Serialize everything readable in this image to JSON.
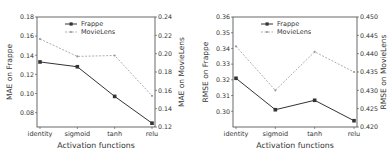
{
  "chart_data": [
    {
      "type": "line",
      "categories": [
        "identity",
        "sigmoid",
        "tanh",
        "relu"
      ],
      "xlabel": "Activation functions",
      "ylabel": "MAE on Frappe",
      "ylabel_right": "MAE on MovieLens",
      "ylim": [
        0.065,
        0.18
      ],
      "ylim_right": [
        0.12,
        0.24
      ],
      "yticks": [
        "0.08",
        "0.10",
        "0.12",
        "0.14",
        "0.16",
        "0.18"
      ],
      "yticks_right": [
        "0.12",
        "0.14",
        "0.16",
        "0.18",
        "0.20",
        "0.22",
        "0.24"
      ],
      "legend_position": "upper center",
      "grid": false,
      "series": [
        {
          "name": "Frappe",
          "axis": "left",
          "style": "solid",
          "marker": "square",
          "values": [
            0.133,
            0.128,
            0.097,
            0.069
          ]
        },
        {
          "name": "MovieLens",
          "axis": "right",
          "style": "dashed",
          "marker": "dot",
          "values": [
            0.216,
            0.197,
            0.198,
            0.154
          ]
        }
      ]
    },
    {
      "type": "line",
      "categories": [
        "identity",
        "sigmoid",
        "tanh",
        "relu"
      ],
      "xlabel": "Activation functions",
      "ylabel": "RMSE on Frappe",
      "ylabel_right": "RMSE on MovieLens",
      "ylim": [
        0.29,
        0.36
      ],
      "ylim_right": [
        0.42,
        0.45
      ],
      "yticks": [
        "0.30",
        "0.31",
        "0.32",
        "0.33",
        "0.34",
        "0.35",
        "0.36"
      ],
      "yticks_right": [
        "0.420",
        "0.425",
        "0.430",
        "0.435",
        "0.440",
        "0.445",
        "0.450"
      ],
      "legend_position": "upper center",
      "grid": false,
      "series": [
        {
          "name": "Frappe",
          "axis": "left",
          "style": "solid",
          "marker": "square",
          "values": [
            0.321,
            0.301,
            0.307,
            0.294
          ]
        },
        {
          "name": "MovieLens",
          "axis": "right",
          "style": "dashed",
          "marker": "dot",
          "values": [
            0.442,
            0.43,
            0.4405,
            0.435
          ]
        }
      ]
    }
  ],
  "colors": {
    "frappe": "#333333",
    "movielens": "#999999",
    "axis": "#444444"
  }
}
